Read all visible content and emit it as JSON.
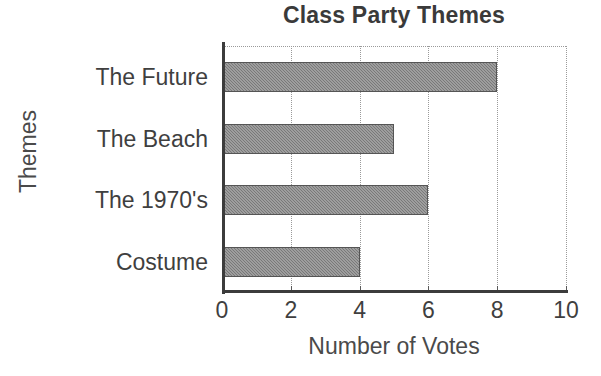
{
  "chart_data": {
    "type": "bar",
    "orientation": "horizontal",
    "title": "Class Party Themes",
    "xlabel": "Number of Votes",
    "ylabel": "Themes",
    "categories": [
      "The Future",
      "The Beach",
      "The 1970's",
      "Costume"
    ],
    "values": [
      8,
      5,
      6,
      4
    ],
    "xlim": [
      0,
      10
    ],
    "xticks": [
      0,
      2,
      4,
      6,
      8,
      10
    ],
    "xtick_labels": [
      "0",
      "2",
      "4",
      "6",
      "8",
      "10"
    ],
    "grid": "vertical dotted gridlines at each x tick, dotted top border",
    "legend": "none",
    "bar_color": "#848484",
    "bar_edge_color": "#555555",
    "axis_color": "#3c3c3c",
    "gridline_color": "#9a9a9a",
    "text_color": "#3f3f3f",
    "background": "#ffffff"
  }
}
